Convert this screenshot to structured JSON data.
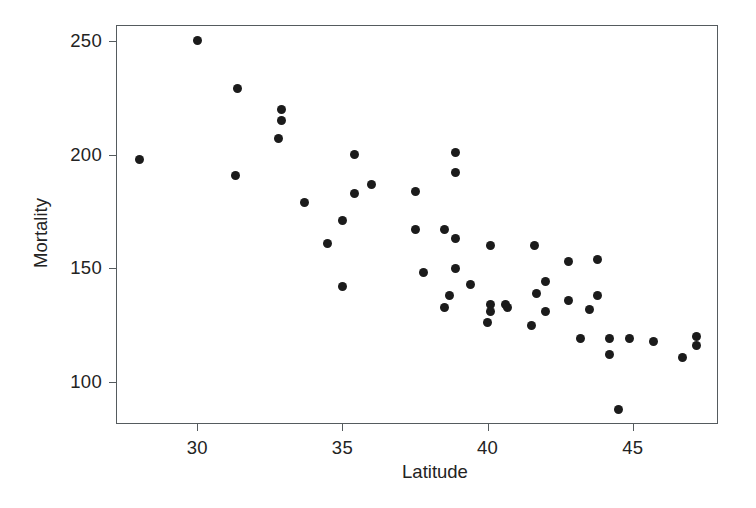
{
  "chart_data": {
    "type": "scatter",
    "title": "",
    "xlabel": "Latitude",
    "ylabel": "Mortality",
    "xlim": [
      27.2,
      47.9
    ],
    "ylim": [
      82,
      257
    ],
    "xticks": [
      30,
      35,
      40,
      45
    ],
    "yticks": [
      100,
      150,
      200,
      250
    ],
    "xticklabels": [
      "30",
      "35",
      "40",
      "45"
    ],
    "yticklabels": [
      "100",
      "150",
      "200",
      "250"
    ],
    "grid": false,
    "legend": null,
    "marker": {
      "shape": "circle",
      "color": "#1b1b1b",
      "size": 9
    },
    "points": [
      {
        "x": 28.0,
        "y": 198
      },
      {
        "x": 30.0,
        "y": 250
      },
      {
        "x": 31.3,
        "y": 191
      },
      {
        "x": 31.4,
        "y": 229
      },
      {
        "x": 32.8,
        "y": 207
      },
      {
        "x": 32.9,
        "y": 220
      },
      {
        "x": 32.9,
        "y": 215
      },
      {
        "x": 33.7,
        "y": 179
      },
      {
        "x": 34.5,
        "y": 161
      },
      {
        "x": 35.0,
        "y": 171
      },
      {
        "x": 35.0,
        "y": 142
      },
      {
        "x": 35.4,
        "y": 200
      },
      {
        "x": 35.4,
        "y": 183
      },
      {
        "x": 36.0,
        "y": 187
      },
      {
        "x": 37.5,
        "y": 184
      },
      {
        "x": 37.5,
        "y": 167
      },
      {
        "x": 37.8,
        "y": 148
      },
      {
        "x": 38.5,
        "y": 167
      },
      {
        "x": 38.5,
        "y": 133
      },
      {
        "x": 38.7,
        "y": 138
      },
      {
        "x": 38.9,
        "y": 201
      },
      {
        "x": 38.9,
        "y": 192
      },
      {
        "x": 38.9,
        "y": 163
      },
      {
        "x": 38.9,
        "y": 150
      },
      {
        "x": 39.4,
        "y": 143
      },
      {
        "x": 40.0,
        "y": 126
      },
      {
        "x": 40.1,
        "y": 160
      },
      {
        "x": 40.1,
        "y": 134
      },
      {
        "x": 40.1,
        "y": 131
      },
      {
        "x": 40.6,
        "y": 134
      },
      {
        "x": 40.7,
        "y": 133
      },
      {
        "x": 41.5,
        "y": 125
      },
      {
        "x": 41.6,
        "y": 160
      },
      {
        "x": 41.7,
        "y": 139
      },
      {
        "x": 42.0,
        "y": 144
      },
      {
        "x": 42.0,
        "y": 131
      },
      {
        "x": 42.8,
        "y": 153
      },
      {
        "x": 42.8,
        "y": 136
      },
      {
        "x": 43.2,
        "y": 119
      },
      {
        "x": 43.5,
        "y": 132
      },
      {
        "x": 43.8,
        "y": 154
      },
      {
        "x": 43.8,
        "y": 138
      },
      {
        "x": 44.2,
        "y": 119
      },
      {
        "x": 44.2,
        "y": 112
      },
      {
        "x": 44.5,
        "y": 88
      },
      {
        "x": 44.9,
        "y": 119
      },
      {
        "x": 45.7,
        "y": 118
      },
      {
        "x": 46.7,
        "y": 111
      },
      {
        "x": 47.2,
        "y": 120
      },
      {
        "x": 47.2,
        "y": 116
      }
    ]
  }
}
